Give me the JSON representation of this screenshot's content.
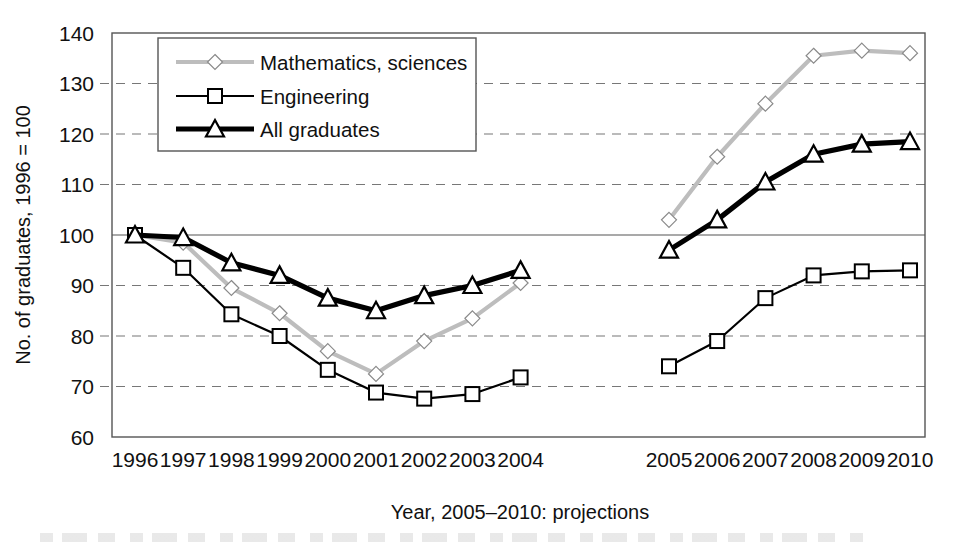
{
  "chart_data": {
    "type": "line",
    "title": "",
    "xlabel": "Year, 2005–2010: projections",
    "ylabel": "No. of graduates, 1996 = 100",
    "ylim": [
      60,
      140
    ],
    "ytick_step": 10,
    "yticks": [
      "140",
      "130",
      "120",
      "110",
      "100",
      "90",
      "80",
      "70",
      "60"
    ],
    "grid": "horizontal dashed, solid reference line at 100",
    "legend_position": "top-left inside plot",
    "categories": [
      "1996",
      "1997",
      "1998",
      "1999",
      "2000",
      "2001",
      "2002",
      "2003",
      "2004",
      "2005",
      "2006",
      "2007",
      "2008",
      "2009",
      "2010"
    ],
    "history_categories": [
      "1996",
      "1997",
      "1998",
      "1999",
      "2000",
      "2001",
      "2002",
      "2003",
      "2004"
    ],
    "projection_categories": [
      "2005",
      "2006",
      "2007",
      "2008",
      "2009",
      "2010"
    ],
    "series": [
      {
        "name": "Mathematics, sciences",
        "marker": "diamond",
        "color": "#b4b4b4",
        "values": [
          100,
          98.5,
          89.5,
          84.5,
          77,
          72.5,
          79,
          83.5,
          90.5,
          103,
          115.5,
          126,
          135.5,
          136.5,
          136
        ],
        "history_values": [
          100,
          98.5,
          89.5,
          84.5,
          77,
          72.5,
          79,
          83.5,
          90.5
        ],
        "projection_values": [
          103,
          115.5,
          126,
          135.5,
          136.5,
          136
        ]
      },
      {
        "name": "Engineering",
        "marker": "square",
        "color": "#000000",
        "values": [
          100,
          93.5,
          84.3,
          80,
          73.3,
          68.8,
          67.6,
          68.5,
          71.8,
          74,
          79,
          87.5,
          92,
          92.8,
          93
        ],
        "history_values": [
          100,
          93.5,
          84.3,
          80,
          73.3,
          68.8,
          67.6,
          68.5,
          71.8
        ],
        "projection_values": [
          74,
          79,
          87.5,
          92,
          92.8,
          93
        ]
      },
      {
        "name": "All graduates",
        "marker": "triangle",
        "color": "#000000",
        "values": [
          100,
          99.5,
          94.5,
          92,
          87.5,
          85,
          88,
          90,
          93,
          97,
          103,
          110.5,
          116,
          118,
          118.5
        ],
        "history_values": [
          100,
          99.5,
          94.5,
          92,
          87.5,
          85,
          88,
          90,
          93
        ],
        "projection_values": [
          97,
          103,
          110.5,
          116,
          118,
          118.5
        ]
      }
    ]
  },
  "legend": {
    "items": [
      {
        "label": "Mathematics, sciences"
      },
      {
        "label": "Engineering"
      },
      {
        "label": "All graduates"
      }
    ]
  }
}
